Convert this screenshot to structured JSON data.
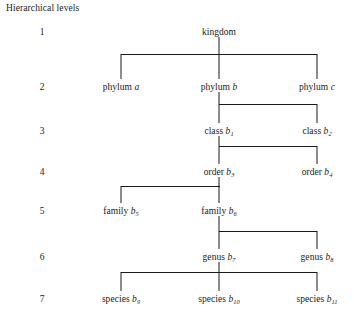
{
  "diagram": {
    "caption": "Hierarchical levels",
    "type": "tree",
    "column_label": "Hierarchical levels",
    "levels": [
      {
        "number": "1",
        "rank": "kingdom"
      },
      {
        "number": "2",
        "rank": "phylum"
      },
      {
        "number": "3",
        "rank": "class"
      },
      {
        "number": "4",
        "rank": "order"
      },
      {
        "number": "5",
        "rank": "family"
      },
      {
        "number": "6",
        "rank": "genus"
      },
      {
        "number": "7",
        "rank": "species"
      }
    ],
    "nodes": [
      {
        "id": "kingdom",
        "level": 1,
        "rank": "kingdom",
        "label": "kingdom",
        "suffix": "",
        "sub": "",
        "column": "center"
      },
      {
        "id": "phylum_a",
        "level": 2,
        "rank": "phylum",
        "label": "phylum",
        "suffix": "a",
        "sub": "",
        "column": "left"
      },
      {
        "id": "phylum_b",
        "level": 2,
        "rank": "phylum",
        "label": "phylum",
        "suffix": "b",
        "sub": "",
        "column": "center"
      },
      {
        "id": "phylum_c",
        "level": 2,
        "rank": "phylum",
        "label": "phylum",
        "suffix": "c",
        "sub": "",
        "column": "right"
      },
      {
        "id": "class_b1",
        "level": 3,
        "rank": "class",
        "label": "class",
        "suffix": "b",
        "sub": "1",
        "column": "center"
      },
      {
        "id": "class_b2",
        "level": 3,
        "rank": "class",
        "label": "class",
        "suffix": "b",
        "sub": "2",
        "column": "right"
      },
      {
        "id": "order_b3",
        "level": 4,
        "rank": "order",
        "label": "order",
        "suffix": "b",
        "sub": "3",
        "column": "center"
      },
      {
        "id": "order_b4",
        "level": 4,
        "rank": "order",
        "label": "order",
        "suffix": "b",
        "sub": "4",
        "column": "right"
      },
      {
        "id": "family_b5",
        "level": 5,
        "rank": "family",
        "label": "family",
        "suffix": "b",
        "sub": "5",
        "column": "left"
      },
      {
        "id": "family_b6",
        "level": 5,
        "rank": "family",
        "label": "family",
        "suffix": "b",
        "sub": "6",
        "column": "center"
      },
      {
        "id": "genus_b7",
        "level": 6,
        "rank": "genus",
        "label": "genus",
        "suffix": "b",
        "sub": "7",
        "column": "center"
      },
      {
        "id": "genus_b8",
        "level": 6,
        "rank": "genus",
        "label": "genus",
        "suffix": "b",
        "sub": "8",
        "column": "right"
      },
      {
        "id": "species_b9",
        "level": 7,
        "rank": "species",
        "label": "species",
        "suffix": "b",
        "sub": "9",
        "column": "left"
      },
      {
        "id": "species_b10",
        "level": 7,
        "rank": "species",
        "label": "species",
        "suffix": "b",
        "sub": "10",
        "column": "center"
      },
      {
        "id": "species_b11",
        "level": 7,
        "rank": "species",
        "label": "species",
        "suffix": "b",
        "sub": "11",
        "column": "right"
      }
    ],
    "edges": [
      {
        "parent": "kingdom",
        "children": [
          "phylum_a",
          "phylum_b",
          "phylum_c"
        ]
      },
      {
        "parent": "phylum_b",
        "children": [
          "class_b1",
          "class_b2"
        ]
      },
      {
        "parent": "class_b1",
        "children": [
          "order_b3",
          "order_b4"
        ]
      },
      {
        "parent": "order_b3",
        "children": [
          "family_b5",
          "family_b6"
        ]
      },
      {
        "parent": "family_b6",
        "children": [
          "genus_b7",
          "genus_b8"
        ]
      },
      {
        "parent": "genus_b7",
        "children": [
          "species_b9",
          "species_b10",
          "species_b11"
        ]
      }
    ],
    "colors": {
      "line": "#1a1a1a",
      "text": "#1a1a1a",
      "background": "#ffffff"
    }
  }
}
